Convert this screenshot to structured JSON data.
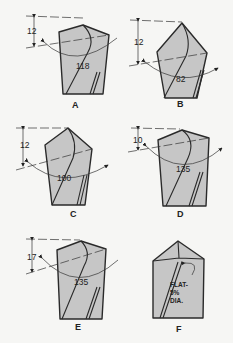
{
  "figure": {
    "colors": {
      "background": "#f6f6f4",
      "drill_body": "#c6c6c6",
      "outline": "#2a2a2a"
    },
    "panels": [
      {
        "label": "A",
        "lip_height": "12",
        "point_angle": "118"
      },
      {
        "label": "B",
        "lip_height": "12",
        "point_angle": "82"
      },
      {
        "label": "C",
        "lip_height": "12",
        "point_angle": "100"
      },
      {
        "label": "D",
        "lip_height": "10",
        "point_angle": "135"
      },
      {
        "label": "E",
        "lip_height": "17",
        "point_angle": "135"
      },
      {
        "label": "F",
        "note_line1": "FLAT-",
        "note_line2": "5%",
        "note_line3": "DIA."
      }
    ]
  }
}
